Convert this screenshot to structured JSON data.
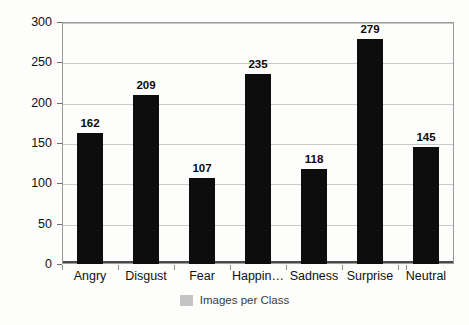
{
  "chart_data": {
    "type": "bar",
    "title": "",
    "xlabel": "",
    "ylabel": "Number of Images",
    "categories": [
      "Angry",
      "Disgust",
      "Fear",
      "Happin…",
      "Sadness",
      "Surprise",
      "Neutral"
    ],
    "values": [
      162,
      209,
      107,
      235,
      118,
      279,
      145
    ],
    "data_labels": [
      "162",
      "209",
      "107",
      "235",
      "118",
      "279",
      "145"
    ],
    "ylim": [
      0,
      300
    ],
    "ytick_labels": [
      "300",
      "250",
      "200",
      "150",
      "100",
      "50",
      "0"
    ],
    "ytick_values": [
      300,
      250,
      200,
      150,
      100,
      50,
      0
    ],
    "grid": true,
    "legend": {
      "position": "bottom-center",
      "entries": [
        {
          "label": "Images per Class",
          "color": "#c4c4c4"
        }
      ]
    },
    "series": [
      {
        "name": "Images per Class",
        "color": "#0d0d0d",
        "values": [
          162,
          209,
          107,
          235,
          118,
          279,
          145
        ]
      }
    ]
  },
  "colors": {
    "bar": "#0d0d0d",
    "grid": "#c8c8c8",
    "axis": "#4a4a4a",
    "plot_border": "#9a9a9a",
    "background": "#fdfdfb",
    "legend_swatch": "#c4c4c4"
  }
}
